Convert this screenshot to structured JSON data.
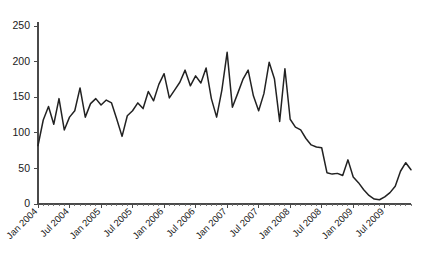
{
  "chart_data": {
    "type": "line",
    "title": "",
    "subtitle": "",
    "xlabel": "",
    "ylabel": "",
    "grid": false,
    "legend": false,
    "legend_position": "none",
    "line_color": "#222222",
    "axis_color": "#4a4a4a",
    "background_color": "#ffffff",
    "ylim": [
      0,
      250
    ],
    "yticks": [
      0,
      50,
      100,
      150,
      200,
      250
    ],
    "ytick_labels": [
      "0",
      "50",
      "100",
      "150",
      "200",
      "250"
    ],
    "xtick_labels": [
      "Jan 2004",
      "Jul 2004",
      "Jan 2005",
      "Jul 2005",
      "Jan 2006",
      "Jul 2006",
      "Jan 2007",
      "Jul 2007",
      "Jan 2008",
      "Jul 2008",
      "Jan 2009",
      "Jul 2009"
    ],
    "xtick_label_rotation": -45,
    "x_interval_months": 6,
    "x_start": "Jan 2004",
    "x_end": "Dec 2009",
    "x": [
      "Jan 2004",
      "Feb 2004",
      "Mar 2004",
      "Apr 2004",
      "May 2004",
      "Jun 2004",
      "Jul 2004",
      "Aug 2004",
      "Sep 2004",
      "Oct 2004",
      "Nov 2004",
      "Dec 2004",
      "Jan 2005",
      "Feb 2005",
      "Mar 2005",
      "Apr 2005",
      "May 2005",
      "Jun 2005",
      "Jul 2005",
      "Aug 2005",
      "Sep 2005",
      "Oct 2005",
      "Nov 2005",
      "Dec 2005",
      "Jan 2006",
      "Feb 2006",
      "Mar 2006",
      "Apr 2006",
      "May 2006",
      "Jun 2006",
      "Jul 2006",
      "Aug 2006",
      "Sep 2006",
      "Oct 2006",
      "Nov 2006",
      "Dec 2006",
      "Jan 2007",
      "Feb 2007",
      "Mar 2007",
      "Apr 2007",
      "May 2007",
      "Jun 2007",
      "Jul 2007",
      "Aug 2007",
      "Sep 2007",
      "Oct 2007",
      "Nov 2007",
      "Dec 2007",
      "Jan 2008",
      "Feb 2008",
      "Mar 2008",
      "Apr 2008",
      "May 2008",
      "Jun 2008",
      "Jul 2008",
      "Aug 2008",
      "Sep 2008",
      "Oct 2008",
      "Nov 2008",
      "Dec 2008",
      "Jan 2009",
      "Feb 2009",
      "Mar 2009",
      "Apr 2009",
      "May 2009",
      "Jun 2009",
      "Jul 2009",
      "Aug 2009",
      "Sep 2009",
      "Oct 2009",
      "Nov 2009",
      "Dec 2009"
    ],
    "values": [
      82,
      118,
      137,
      112,
      148,
      104,
      122,
      131,
      163,
      122,
      141,
      148,
      139,
      146,
      142,
      119,
      95,
      124,
      131,
      142,
      134,
      158,
      145,
      168,
      183,
      149,
      160,
      171,
      188,
      166,
      180,
      170,
      191,
      148,
      122,
      160,
      213,
      136,
      155,
      175,
      188,
      152,
      131,
      155,
      199,
      176,
      116,
      190,
      119,
      108,
      104,
      92,
      83,
      80,
      79,
      44,
      42,
      43,
      40,
      62,
      38,
      30,
      20,
      12,
      7,
      6,
      10,
      16,
      25,
      46,
      58,
      48
    ],
    "series": [
      {
        "name": "series-1",
        "values": [
          82,
          118,
          137,
          112,
          148,
          104,
          122,
          131,
          163,
          122,
          141,
          148,
          139,
          146,
          142,
          119,
          95,
          124,
          131,
          142,
          134,
          158,
          145,
          168,
          183,
          149,
          160,
          171,
          188,
          166,
          180,
          170,
          191,
          148,
          122,
          160,
          213,
          136,
          155,
          175,
          188,
          152,
          131,
          155,
          199,
          176,
          116,
          190,
          119,
          108,
          104,
          92,
          83,
          80,
          79,
          44,
          42,
          43,
          40,
          62,
          38,
          30,
          20,
          12,
          7,
          6,
          10,
          16,
          25,
          46,
          58,
          48
        ]
      }
    ],
    "annotations": [],
    "peak_value": 213,
    "peak_label": "Jan 2007",
    "min_value": 6,
    "min_label": "Jun 2009"
  },
  "layout": {
    "plot_left": 38,
    "plot_right": 411,
    "plot_top": 26,
    "plot_bottom": 204,
    "width": 426,
    "height": 266
  }
}
